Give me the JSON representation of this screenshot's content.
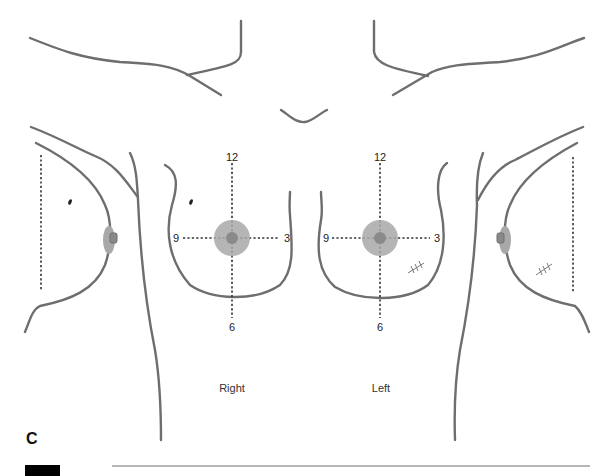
{
  "figure": {
    "panel_letter": "C",
    "side_labels": {
      "right": "Right",
      "left": "Left"
    },
    "clock_positions": {
      "right_breast": {
        "top": "12",
        "bottom": "6",
        "left": "9",
        "right": "3"
      },
      "left_breast": {
        "top": "12",
        "bottom": "6",
        "left": "9",
        "right": "3"
      }
    },
    "colors": {
      "outline": "#6e6e6e",
      "areola": "#a8a8a8",
      "nipple": "#8a8a8a",
      "guide_lines": "#333333",
      "accent_block": "#000000"
    },
    "markings": {
      "right_breast_mole": "lesion-mark",
      "left_breast_scar": "suture-scar",
      "left_lateral_scar": "suture-scar",
      "right_lateral_mole": "lesion-mark"
    }
  }
}
